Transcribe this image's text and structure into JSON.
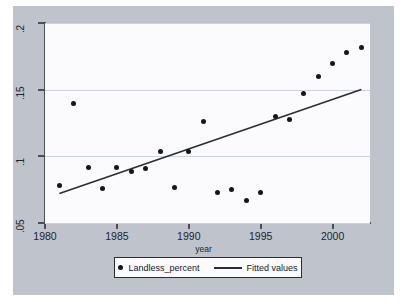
{
  "chart_data": {
    "type": "scatter",
    "title": "",
    "xlabel": "year",
    "ylabel": "",
    "xlim": [
      1980,
      2002.6
    ],
    "ylim": [
      0.05,
      0.2
    ],
    "grid": true,
    "x_ticks": [
      1980,
      1985,
      1990,
      1995,
      2000
    ],
    "x_tick_labels": [
      "1980",
      "1985",
      "1990",
      "1995",
      "2000"
    ],
    "y_ticks": [
      0.05,
      0.1,
      0.15,
      0.2
    ],
    "y_tick_labels": [
      ".05",
      ".1",
      ".15",
      ".2"
    ],
    "legend_position": "bottom-center",
    "series": [
      {
        "name": "Landless_percent",
        "type": "scatter",
        "marker": "filled-circle",
        "color": "#14161c",
        "points": [
          {
            "x": 1981,
            "y": 0.078
          },
          {
            "x": 1982,
            "y": 0.14
          },
          {
            "x": 1983,
            "y": 0.092
          },
          {
            "x": 1984,
            "y": 0.076
          },
          {
            "x": 1985,
            "y": 0.092
          },
          {
            "x": 1986,
            "y": 0.089
          },
          {
            "x": 1987,
            "y": 0.091
          },
          {
            "x": 1988,
            "y": 0.104
          },
          {
            "x": 1989,
            "y": 0.077
          },
          {
            "x": 1990,
            "y": 0.104
          },
          {
            "x": 1991,
            "y": 0.126
          },
          {
            "x": 1992,
            "y": 0.073
          },
          {
            "x": 1993,
            "y": 0.075
          },
          {
            "x": 1994,
            "y": 0.067
          },
          {
            "x": 1995,
            "y": 0.073
          },
          {
            "x": 1996,
            "y": 0.13
          },
          {
            "x": 1997,
            "y": 0.128
          },
          {
            "x": 1998,
            "y": 0.147
          },
          {
            "x": 1999,
            "y": 0.16
          },
          {
            "x": 2000,
            "y": 0.17
          },
          {
            "x": 2001,
            "y": 0.178
          },
          {
            "x": 2002,
            "y": 0.182
          }
        ]
      },
      {
        "name": "Fitted values",
        "type": "line",
        "color": "#2a2d35",
        "points": [
          {
            "x": 1981,
            "y": 0.0722
          },
          {
            "x": 2002,
            "y": 0.1502
          }
        ]
      }
    ],
    "legend": [
      {
        "label": "Landless_percent",
        "marker": "filled-circle"
      },
      {
        "label": "Fitted values",
        "marker": "line"
      }
    ]
  },
  "colors": {
    "figure_background": "#bfc3cc",
    "plot_background": "#fbfbfd",
    "gridline": "#ccd2e0",
    "axis": "#4b4f5a",
    "marker": "#14161c",
    "fit_line": "#2a2d35"
  }
}
